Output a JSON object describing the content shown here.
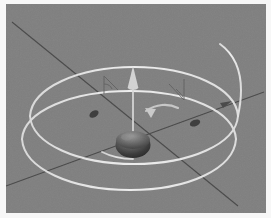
{
  "figure": {
    "title": "3D helical orbit around central body",
    "background_color": "#7f7f7f",
    "page_color": "#f7f7f7",
    "curve_color": "#e2e2e2",
    "axis_color": "#4a4a4a",
    "body_color": "#3c3c3c",
    "arrow_color": "#d6d6d6",
    "angle_mark_color": "#5a5a5a"
  },
  "scene": {
    "central_body": {
      "name": "central-sphere",
      "cx": 133,
      "cy": 142,
      "rx": 17,
      "ry": 12
    },
    "spin_arrow": {
      "name": "spin-axis-arrow",
      "x": 133,
      "y_tip": 74,
      "y_tail": 142,
      "direction": "up"
    },
    "precession_arrow": {
      "name": "precession-curved-arrow",
      "label": "precession"
    },
    "orbits": [
      {
        "name": "outer-orbit-loop",
        "cx": 131,
        "cy": 106,
        "rx": 107,
        "ry": 41,
        "rotate": -6
      },
      {
        "name": "inner-orbit-loop",
        "cx": 131,
        "cy": 131,
        "rx": 107,
        "ry": 41,
        "rotate": -6
      }
    ],
    "axes": [
      {
        "name": "axis-line-a",
        "x1": 9,
        "y1": 26,
        "x2": 236,
        "y2": 208,
        "arrow": false
      },
      {
        "name": "axis-line-b",
        "x1": 4,
        "y1": 186,
        "x2": 252,
        "y2": 95,
        "arrow": true
      }
    ],
    "orbit_markers": [
      {
        "name": "orbit-marker-left",
        "cx": 92,
        "cy": 113,
        "r": 4,
        "rot": -28
      },
      {
        "name": "orbit-marker-right",
        "cx": 197,
        "cy": 122,
        "r": 4,
        "rot": -28
      }
    ],
    "angle_marks": [
      {
        "name": "angle-mark-left",
        "x": 103,
        "y": 78
      },
      {
        "name": "angle-mark-right",
        "x": 168,
        "y": 83
      }
    ]
  },
  "labels": {
    "none_visible": ""
  }
}
